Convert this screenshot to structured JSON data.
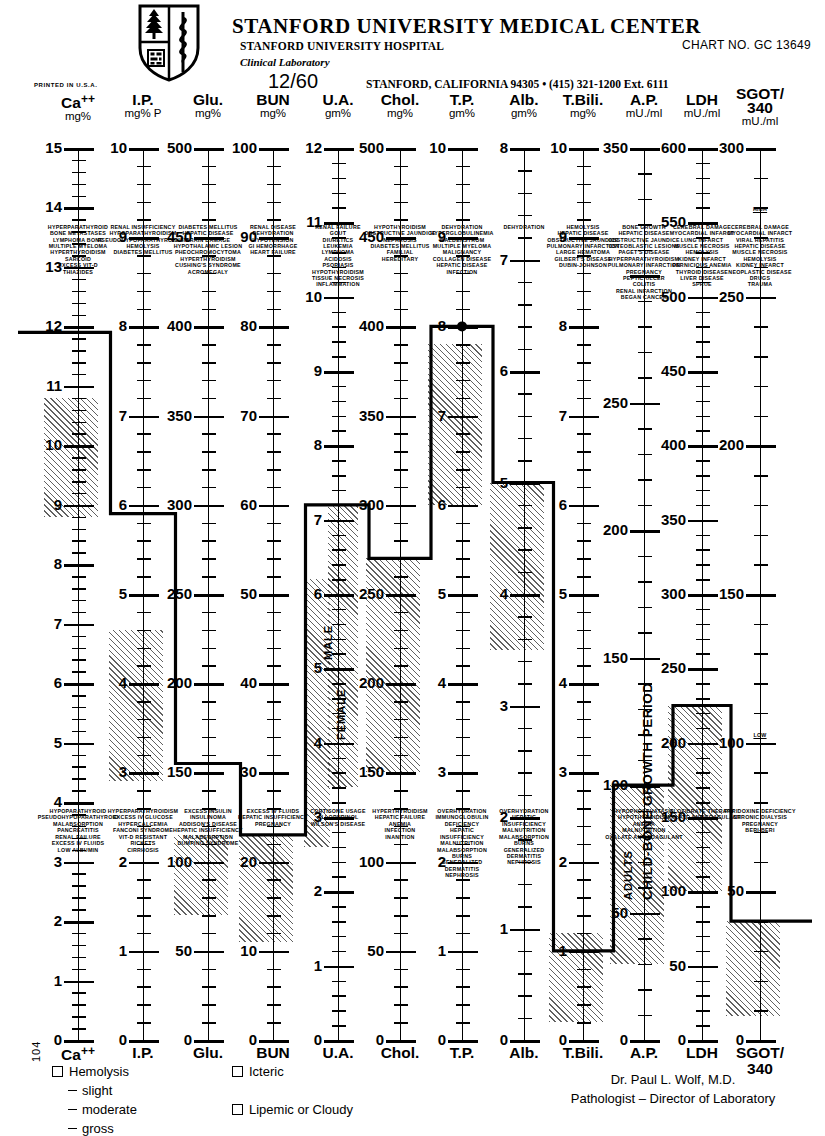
{
  "header": {
    "title": "STANFORD UNIVERSITY MEDICAL CENTER",
    "sub1": "STANFORD UNIVERSITY HOSPITAL",
    "sub2": "Clinical Laboratory",
    "chart_no": "CHART NO. GC 13649",
    "date": "12/60",
    "address": "STANFORD, CALIFORNIA 94305  •  (415) 321-1200 Ext. 6111",
    "printed_in": "PRINTED IN U.S.A.",
    "logo": "stanford-shield-logo"
  },
  "footer": {
    "doctor": "Dr. Paul L. Wolf, M.D.",
    "role": "Pathologist – Director of Laboratory",
    "side_number": "104",
    "legend_left": [
      {
        "type": "box",
        "label": "Hemolysis"
      },
      {
        "type": "dash",
        "label": "slight"
      },
      {
        "type": "dash",
        "label": "moderate"
      },
      {
        "type": "dash",
        "label": "gross"
      }
    ],
    "legend_right": [
      {
        "type": "box",
        "label": "Icteric"
      },
      {
        "type": "box",
        "label": "Lipemic  or Cloudy"
      }
    ]
  },
  "chart_data": {
    "type": "chart",
    "note": "Vertical parallel scales, one per analyte; hatched bands = normal reference range; heavy stepped line = patient result profile.",
    "columns": [
      {
        "name": "Ca",
        "superscript": "++",
        "units": "mg%",
        "footer_name": "Ca",
        "footer_sup": "++",
        "axis": {
          "max": 15,
          "min": 0,
          "major_step": 1,
          "minor_per_major": 4
        },
        "ticklabels": [
          15,
          14,
          13,
          12,
          11,
          10,
          9,
          8,
          7,
          6,
          5,
          4,
          3,
          2,
          1,
          0
        ],
        "normal_range": [
          8.8,
          10.8
        ],
        "result": 11.9,
        "high_annotations": [
          "HYPERPARATHYROID",
          "BONE METASTASES",
          "LYMPHOMA BONE",
          "MULTIPLE MYELOMA",
          "HYPERTHYROIDISM",
          "SARCOID",
          "EXCESS VIT-D",
          "THIAZIDES"
        ],
        "low_annotations": [
          "HYPOPARATHYROID",
          "PSEUDOHYPOPARATHYROID",
          "MALABSORPTION",
          "PANCREATITIS",
          "RENAL FAILURE",
          "EXCESS IV FLUIDS",
          "LOW ALBUMIN"
        ]
      },
      {
        "name": "I.P.",
        "superscript": "",
        "units": "mg% P",
        "footer_name": "I.P.",
        "footer_sup": "",
        "axis": {
          "max": 10,
          "min": 0,
          "major_step": 1,
          "minor_per_major": 4
        },
        "ticklabels": [
          10,
          9,
          8,
          7,
          6,
          5,
          4,
          3,
          2,
          1,
          0
        ],
        "normal_range": [
          2.9,
          4.6
        ],
        "result": 5.9,
        "high_annotations": [
          "RENAL INSUFFICIENCY",
          "HYPOPARATHYROIDISM",
          "PSEUDOHYPOPARATHYROIDISM",
          "HEMOLYSIS",
          "DIABETES MELLITUS"
        ],
        "low_annotations": [
          "HYPERPARATHYROIDISM",
          "EXCESS IV GLUCOSE",
          "HYPERCALCEMIA",
          "FANCONI SYNDROME",
          "VIT-D RESISTANT",
          "RICKETS",
          "CIRRHOSIS"
        ]
      },
      {
        "name": "Glu.",
        "superscript": "",
        "units": "mg%",
        "footer_name": "Glu.",
        "footer_sup": "",
        "axis": {
          "max": 500,
          "min": 0,
          "major_step": 50,
          "minor_per_major": 4
        },
        "ticklabels": [
          500,
          450,
          400,
          350,
          300,
          250,
          200,
          150,
          100,
          50,
          0
        ],
        "normal_range": [
          70,
          115
        ],
        "result": 155,
        "high_annotations": [
          "DIABETES MELLITUS",
          "HEPATIC DISEASE",
          "BRAIN DAMAGE",
          "HYPOTHALAMIC LESION",
          "PHEOCHROMOCYTOMA",
          "HYPERTHYROIDISM",
          "CUSHING'S SYNDROME",
          "ACROMEGALY"
        ],
        "low_annotations": [
          "EXCESS INSULIN",
          "INSULINOMA",
          "ADDISON'S DISEASE",
          "HEPATIC INSUFFICIENCY",
          "MALABSORPTION",
          "DUMPING SYNDROME"
        ]
      },
      {
        "name": "BUN",
        "superscript": "",
        "units": "mg%",
        "footer_name": "BUN",
        "footer_sup": "",
        "axis": {
          "max": 100,
          "min": 0,
          "major_step": 10,
          "minor_per_major": 4
        },
        "ticklabels": [
          100,
          90,
          80,
          70,
          60,
          50,
          40,
          30,
          20,
          10,
          0
        ],
        "normal_range": [
          11,
          23
        ],
        "result": 23,
        "high_annotations": [
          "RENAL DISEASE",
          "DEHYDRATION",
          "HYPOTENSION",
          "GI HEMORRHAGE",
          "HEART FAILURE"
        ],
        "low_annotations": [
          "EXCESS IV FLUIDS",
          "HEPATIC INSUFFICIENCY",
          "PREGNANCY"
        ]
      },
      {
        "name": "U.A.",
        "superscript": "",
        "units": "gm%",
        "footer_name": "U.A.",
        "footer_sup": "",
        "axis": {
          "max": 12,
          "min": 0,
          "major_step": 1,
          "minor_per_major": 4
        },
        "ticklabels": [
          12,
          11,
          10,
          9,
          8,
          7,
          6,
          5,
          4,
          3,
          2,
          1,
          0
        ],
        "normal_range_male": [
          3.4,
          7.2
        ],
        "normal_range_female": [
          2.6,
          6.2
        ],
        "vertical_labels": [
          "MALE",
          "FEMALE"
        ],
        "result": 7.2,
        "high_annotations": [
          "RENAL FAILURE",
          "GOUT",
          "DIURETICS",
          "LEUKEMIA",
          "LYMPHOMA",
          "ACIDOSIS",
          "PSORIASIS",
          "HYPOTHYROIDISM",
          "TISSUE NECROSIS",
          "INFLAMMATION"
        ],
        "low_annotations": [
          "CORTISONE USAGE",
          "ALLOPURINOL",
          "WILSON'S DISEASE"
        ]
      },
      {
        "name": "Chol.",
        "superscript": "",
        "units": "mg%",
        "footer_name": "Chol.",
        "footer_sup": "",
        "axis": {
          "max": 500,
          "min": 0,
          "major_step": 50,
          "minor_per_major": 4
        },
        "ticklabels": [
          500,
          450,
          400,
          350,
          300,
          250,
          200,
          150,
          100,
          50,
          0
        ],
        "normal_range": [
          150,
          270
        ],
        "result": 270,
        "high_annotations": [
          "HYPOTHYROIDISM",
          "OBSTRUCTIVE JAUNDICE",
          "NEPHROSIS",
          "DIABETES MELLITUS",
          "FAMILIAL",
          "HEREDITARY"
        ],
        "low_annotations": [
          "HYPERTHYROIDISM",
          "HEPATIC FAILURE",
          "ANEMIA",
          "INFECTION",
          "INANITION"
        ]
      },
      {
        "name": "T.P.",
        "superscript": "",
        "units": "gm%",
        "footer_name": "T.P.",
        "footer_sup": "",
        "axis": {
          "max": 10,
          "min": 0,
          "major_step": 1,
          "minor_per_major": 4
        },
        "ticklabels": [
          10,
          9,
          8,
          7,
          6,
          5,
          4,
          3,
          2,
          1,
          0
        ],
        "normal_range": [
          6.0,
          7.8
        ],
        "result": 8.0,
        "high_annotations": [
          "DEHYDRATION",
          "HYPERGLOBULINEMIA",
          "WALDENSTROM",
          "MULTIPLE MYELOMA",
          "MALIGNANCY",
          "COLLAGEN DISEASE",
          "HEPATIC DISEASE",
          "INFECTION"
        ],
        "mid_annotations": [
          "DEHYDRATION"
        ],
        "low_annotations": [
          "OVERHYDRATION",
          "IMMUNOGLOBULIN",
          "DEFICIENCY",
          "HEPATIC",
          "INSUFFICIENCY",
          "MALNUTRITION",
          "MALABSORPTION",
          "BURNS",
          "GENERALIZED",
          "DERMATITIS",
          "NEPHROSIS"
        ]
      },
      {
        "name": "Alb.",
        "superscript": "",
        "units": "gm%",
        "footer_name": "Alb.",
        "footer_sup": "",
        "axis": {
          "max": 8,
          "min": 0,
          "major_step": 1,
          "minor_per_major": 4
        },
        "ticklabels": [
          8,
          7,
          6,
          5,
          4,
          3,
          2,
          1,
          0
        ],
        "normal_range": [
          3.5,
          5.0
        ],
        "result": 5.0,
        "high_annotations": [
          "DEHYDRATION"
        ],
        "low_annotations": [
          "OVERHYDRATION",
          "HEPATIC",
          "INSUFFICIENCY",
          "MALNUTRITION",
          "MALABSORPTION",
          "BURNS",
          "GENERALIZED",
          "DERMATITIS",
          "NEPHROSIS"
        ]
      },
      {
        "name": "T.Bili.",
        "superscript": "",
        "units": "mg%",
        "footer_name": "T.Bili.",
        "footer_sup": "",
        "axis": {
          "max": 10,
          "min": 0,
          "major_step": 1,
          "minor_per_major": 4
        },
        "ticklabels": [
          10,
          9,
          8,
          7,
          6,
          5,
          4,
          3,
          2,
          1,
          0
        ],
        "normal_range": [
          0.2,
          1.2
        ],
        "result": 1.0,
        "high_annotations": [
          "HEMOLYSIS",
          "HEPATIC DISEASE",
          "OBSTRUCTIVE JAUNDICE",
          "PULMONARY INFARCTION",
          "LARGE HEMATOMA",
          "GILBERT'S DISEASE",
          "DUBIN-JOHNSON"
        ],
        "low_annotations": []
      },
      {
        "name": "A.P.",
        "superscript": "",
        "units": "mU./ml",
        "footer_name": "A.P.",
        "footer_sup": "",
        "axis": {
          "max": 350,
          "min": 0,
          "major_step": 50,
          "minor_per_major": 4
        },
        "ticklabels": [
          350,
          250,
          200,
          150,
          100,
          50,
          0
        ],
        "normal_range": [
          30,
          100
        ],
        "vertical_labels": [
          "CHILD-BONE GROWTH PERIOD",
          "ADULTS"
        ],
        "result": 100,
        "high_annotations": [
          "BONE GROWTH",
          "HEPATIC DISEASE",
          "OBSTRUCTIVE JAUNDICE",
          "OSTEOBLASTIC LESIONS",
          "PAGET'S DISEASE",
          "HYPERPARATHYROIDISM",
          "PULMONARY INFARCTION",
          "PREGNANCY",
          "PEPTIC ULCER",
          "COLITIS",
          "RENAL INFARCTION",
          "BEGAN CANCER"
        ],
        "low_annotations": [
          "HYPOPHOSPHATASIA",
          "HYPOTHYROIDISM",
          "ANEMIA",
          "MALNUTRITION",
          "OXALATE ANTICOAGULANT"
        ]
      },
      {
        "name": "LDH",
        "superscript": "",
        "units": "mU./ml",
        "footer_name": "LDH",
        "footer_sup": "",
        "axis": {
          "max": 600,
          "min": 0,
          "major_step": 50,
          "minor_per_major": 4
        },
        "ticklabels": [
          600,
          550,
          500,
          450,
          400,
          350,
          300,
          250,
          200,
          150,
          100,
          50,
          0
        ],
        "normal_range": [
          100,
          225
        ],
        "result": 225,
        "high_annotations": [
          "CEREBRAL DAMAGE",
          "MYOCARDIAL INFARCT",
          "LUNG INFARCT",
          "MUSCLE NECROSIS",
          "HEMOLYSIS",
          "KIDNEY INFARCT",
          "PERNICIOUS ANEMIA",
          "THYROID DISEASE",
          "LIVER DISEASE",
          "SPRUE"
        ],
        "low_annotations": [
          "CLOFIBRATE THERAPY",
          "OXALATE ANTICOAGULANT"
        ]
      },
      {
        "name": "SGOT/",
        "superscript": "",
        "name2": "340",
        "units": "mU./ml",
        "footer_name": "SGOT/",
        "footer_sup": "340",
        "axis": {
          "max": 300,
          "min": 0,
          "major_step": 50,
          "minor_per_major": 4
        },
        "ticklabels": [
          300,
          250,
          200,
          150,
          100,
          50,
          0
        ],
        "normal_range": [
          8,
          40
        ],
        "result": 40,
        "label_high": "HIGH",
        "label_low": "LOW",
        "high_annotations": [
          "CEREBRAL DAMAGE",
          "MYOCARDIAL INFARCT",
          "VIRAL HEPATITIS",
          "HEPATIC DISEASE",
          "MUSCLE NECROSIS",
          "HEMOLYSIS",
          "KIDNEY INFARCT",
          "NEOPLASTIC DISEASE",
          "DRUGS",
          "TRAUMA"
        ],
        "low_annotations": [
          "PYRIDOXINE DEFICIENCY",
          "CHRONIC DIALYSIS",
          "PREGNANCY",
          "BERI-BERI"
        ]
      }
    ]
  }
}
